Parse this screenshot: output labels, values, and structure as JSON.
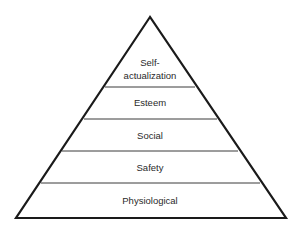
{
  "diagram": {
    "type": "pyramid",
    "levels": [
      {
        "label_lines": [
          "Self-",
          "actualization"
        ]
      },
      {
        "label": "Esteem"
      },
      {
        "label": "Social"
      },
      {
        "label": "Safety"
      },
      {
        "label": "Physiological"
      }
    ]
  }
}
